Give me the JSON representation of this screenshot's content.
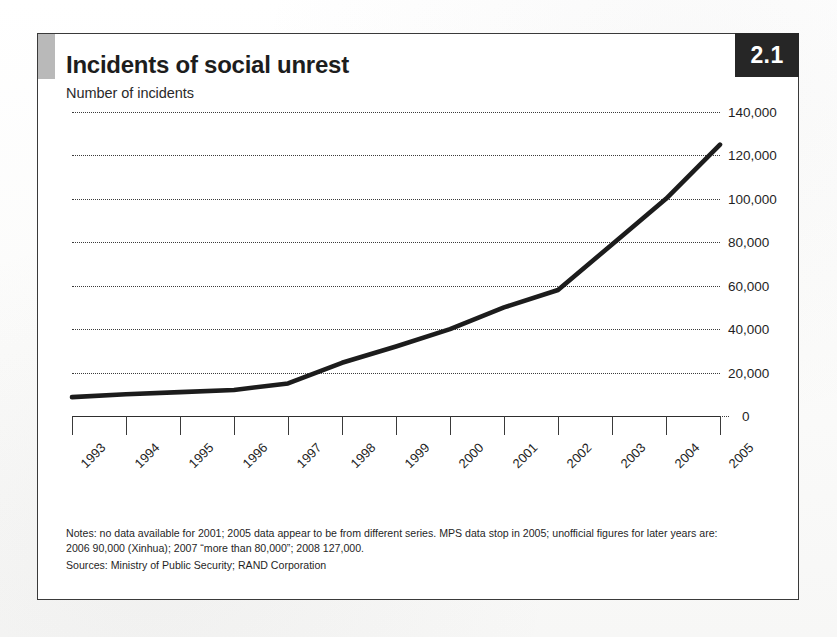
{
  "figure": {
    "number": "2.1",
    "title": "Incidents of social unrest",
    "subtitle": "Number of incidents"
  },
  "notes": {
    "line1": "Notes: no data available for 2001; 2005 data appear to be from different series. MPS data stop in 2005; unofficial figures for later years are:",
    "line2": "2006 90,000 (Xinhua); 2007 “more than 80,000”; 2008 127,000.",
    "sources": "Sources: Ministry of Public Security; RAND Corporation"
  },
  "colors": {
    "line": "#1c1c1c",
    "grid": "#3b3b3b",
    "axis": "#2e2e2e",
    "badge_bg": "#262626",
    "badge_text": "#ffffff",
    "tab_accent": "#b9b9b9",
    "frame": "#3a3a3a",
    "background": "#ffffff"
  },
  "chart_data": {
    "type": "line",
    "title": "Incidents of social unrest",
    "subtitle": "Number of incidents",
    "xlabel": "",
    "ylabel": "Number of incidents",
    "categories": [
      "1993",
      "1994",
      "1995",
      "1996",
      "1997",
      "1998",
      "1999",
      "2000",
      "2001",
      "2002",
      "2003",
      "2004",
      "2005"
    ],
    "values": [
      8700,
      10000,
      11000,
      12000,
      15000,
      24500,
      32000,
      40000,
      50000,
      58000,
      79000,
      100000,
      125000
    ],
    "series": [
      {
        "name": "Incidents of social unrest",
        "values": [
          8700,
          10000,
          11000,
          12000,
          15000,
          24500,
          32000,
          40000,
          50000,
          58000,
          79000,
          100000,
          125000
        ]
      }
    ],
    "ylim": [
      0,
      140000
    ],
    "yticks": [
      0,
      20000,
      40000,
      60000,
      80000,
      100000,
      120000,
      140000
    ],
    "ytick_labels": [
      "0",
      "20,000",
      "40,000",
      "60,000",
      "80,000",
      "100,000",
      "120,000",
      "140,000"
    ],
    "ytick_side": "right",
    "xtick_labels": [
      "1993",
      "1994",
      "1995",
      "1996",
      "1997",
      "1998",
      "1999",
      "2000",
      "2001",
      "2002",
      "2003",
      "2004",
      "2005"
    ],
    "xtick_rotation": -45,
    "grid": "horizontal-dotted",
    "legend": "none"
  }
}
